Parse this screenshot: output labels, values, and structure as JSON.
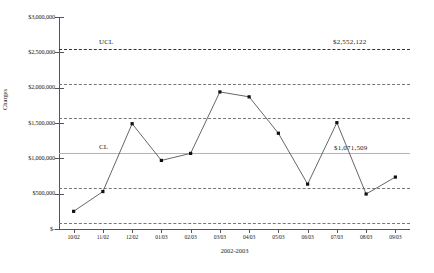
{
  "chart_data": {
    "type": "line",
    "title": "",
    "xlabel": "2002-2003",
    "ylabel": "Charges",
    "categories": [
      "10/02",
      "11/02",
      "12/02",
      "01/03",
      "02/03",
      "03/03",
      "04/03",
      "05/03",
      "06/03",
      "07/03",
      "08/03",
      "09/03"
    ],
    "series": [
      {
        "name": "Charges",
        "values": [
          250000,
          530000,
          1490000,
          970000,
          1070000,
          1940000,
          1870000,
          1355000,
          635000,
          1505000,
          495000,
          735000
        ]
      }
    ],
    "ylim": [
      0,
      3000000
    ],
    "ytick_values": [
      0,
      500000,
      1000000,
      1500000,
      2000000,
      2500000,
      3000000
    ],
    "ytick_labels": [
      "$-",
      "$500,000",
      "$1,000,000",
      "$1,500,000",
      "$2,000,000",
      "$2,500,000",
      "$3,000,000"
    ],
    "grid": false,
    "legend": "none",
    "control_lines": [
      {
        "name": "ucl",
        "label": "UCL",
        "value": 2552122,
        "value_label": "$2,552,122",
        "style": "dashed"
      },
      {
        "name": "sigma-upper-2",
        "label": "",
        "value": 2058551,
        "value_label": "",
        "style": "dash-dot"
      },
      {
        "name": "sigma-upper-1",
        "label": "",
        "value": 1565030,
        "value_label": "",
        "style": "dash-dot"
      },
      {
        "name": "cl",
        "label": "CL",
        "value": 1071509,
        "value_label": "$1,071,509",
        "style": "solid"
      },
      {
        "name": "sigma-lower-1",
        "label": "",
        "value": 577988,
        "value_label": "",
        "style": "dash-dot"
      },
      {
        "name": "sigma-lower-2",
        "label": "",
        "value": 84467,
        "value_label": "",
        "style": "dash-dot"
      }
    ],
    "annotations": [
      {
        "name": "ucl-text",
        "text": "UCL"
      },
      {
        "name": "ucl-value",
        "text": "$2,552,122"
      },
      {
        "name": "cl-text",
        "text": "CL"
      },
      {
        "name": "cl-value",
        "text": "$1,071,509"
      }
    ],
    "marker": "square",
    "marker_color": "#111111",
    "line_color": "#555555"
  }
}
